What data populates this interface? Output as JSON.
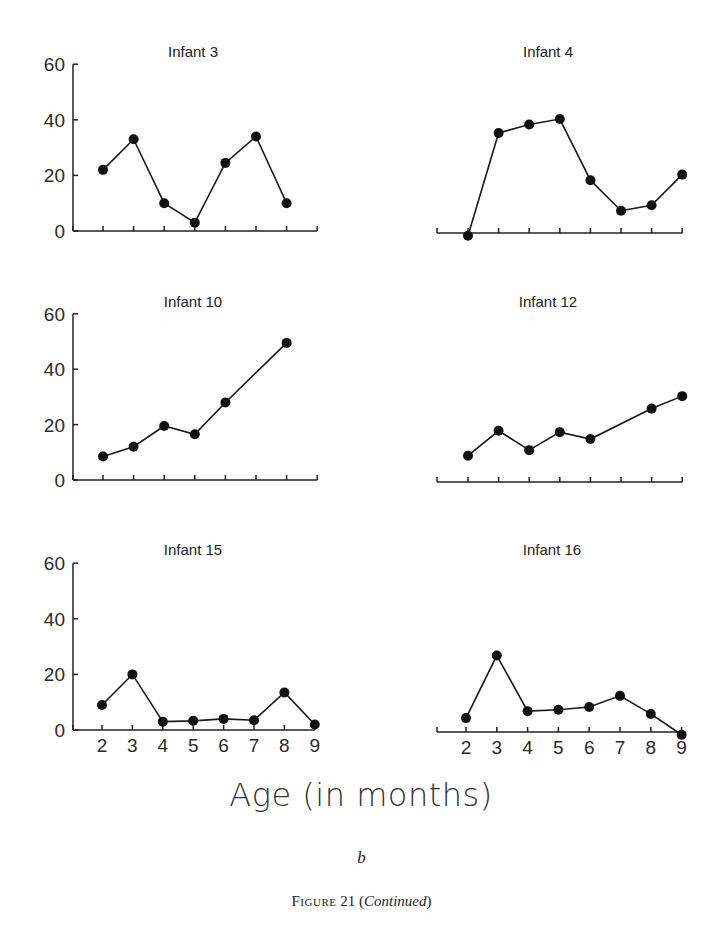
{
  "figure": {
    "xlabel": "Age (in months)",
    "sublabel": "b",
    "caption_prefix": "Figure",
    "caption_number": "21",
    "caption_note": "Continued"
  },
  "chart_data": {
    "type": "line",
    "title": "",
    "xlabel": "Age (in months)",
    "ylabel": "",
    "x": [
      2,
      3,
      4,
      5,
      6,
      7,
      8,
      9
    ],
    "ylim": [
      0,
      60
    ],
    "yticks": [
      0,
      20,
      40,
      60
    ],
    "grid": false,
    "legend": "none",
    "panels": [
      {
        "name": "Infant 3",
        "show_yaxis": true,
        "show_xticklabels": false,
        "values": [
          22,
          33,
          10,
          3,
          24.5,
          34,
          10,
          null
        ]
      },
      {
        "name": "Infant 4",
        "show_yaxis": false,
        "show_xticklabels": false,
        "values": [
          -1,
          36,
          39,
          41,
          19,
          8,
          10,
          21
        ]
      },
      {
        "name": "Infant 10",
        "show_yaxis": true,
        "show_xticklabels": false,
        "values": [
          8.5,
          12,
          19.5,
          16.5,
          28,
          null,
          49.5,
          null
        ]
      },
      {
        "name": "Infant 12",
        "show_yaxis": false,
        "show_xticklabels": false,
        "values": [
          9.5,
          18.5,
          11.5,
          18,
          15.5,
          null,
          26.5,
          31
        ]
      },
      {
        "name": "Infant 15",
        "show_yaxis": true,
        "show_xticklabels": true,
        "values": [
          9,
          20,
          3,
          3.3,
          4,
          3.5,
          13.5,
          2
        ]
      },
      {
        "name": "Infant 16",
        "show_yaxis": false,
        "show_xticklabels": true,
        "values": [
          5,
          27.5,
          7.5,
          8,
          9,
          13,
          6.5,
          -1
        ]
      }
    ]
  }
}
